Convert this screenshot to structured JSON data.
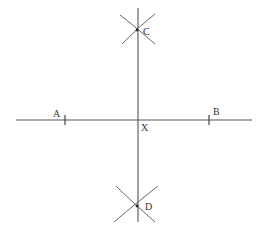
{
  "diagram": {
    "colors": {
      "line": "#555555",
      "arc": "#555555",
      "label": "#333333",
      "background": "#ffffff"
    },
    "points": [
      {
        "id": "A",
        "label": "A",
        "x": 65,
        "y": 120
      },
      {
        "id": "B",
        "label": "B",
        "x": 209,
        "y": 120
      },
      {
        "id": "X",
        "label": "X",
        "x": 138,
        "y": 120
      },
      {
        "id": "C",
        "label": "C",
        "x": 137,
        "y": 31
      },
      {
        "id": "D",
        "label": "D",
        "x": 137,
        "y": 206
      }
    ],
    "lines": [
      {
        "id": "AB",
        "description": "horizontal segment through A and B",
        "x1": 16,
        "y1": 120,
        "x2": 252,
        "y2": 120
      },
      {
        "id": "CD",
        "description": "vertical perpendicular bisector through C, X, D",
        "x1": 138,
        "y1": 8,
        "x2": 138,
        "y2": 222
      }
    ],
    "arcs": [
      {
        "id": "arc-from-A-top",
        "near": "C"
      },
      {
        "id": "arc-from-B-top",
        "near": "C"
      },
      {
        "id": "arc-from-A-bottom",
        "near": "D"
      },
      {
        "id": "arc-from-B-bottom",
        "near": "D"
      }
    ]
  }
}
